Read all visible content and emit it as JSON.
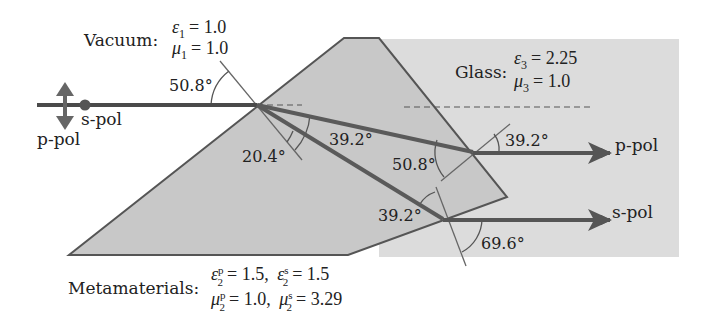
{
  "colors": {
    "glass_fill": "#dcdcdc",
    "meta_fill": "#c8c8c8",
    "beam": "#4a4a4a",
    "outline": "#555555",
    "normal_line": "#666666",
    "text": "#222222"
  },
  "media": {
    "vacuum": {
      "name": "Vacuum:",
      "eps_sym": "ε",
      "eps_sub": "1",
      "eps_val": "= 1.0",
      "mu_sym": "μ",
      "mu_sub": "1",
      "mu_val": "= 1.0"
    },
    "glass": {
      "name": "Glass:",
      "eps_sym": "ε",
      "eps_sub": "3",
      "eps_val": "= 2.25",
      "mu_sym": "μ",
      "mu_sub": "3",
      "mu_val": "= 1.0"
    },
    "metamaterial": {
      "name": "Metamaterials:",
      "eps_p_sym": "ε",
      "eps_p_sup": "p",
      "eps_p_sub": "2",
      "eps_p_val": "= 1.5,",
      "eps_s_sym": "ε",
      "eps_s_sup": "s",
      "eps_s_sub": "2",
      "eps_s_val": "= 1.5",
      "mu_p_sym": "μ",
      "mu_p_sup": "p",
      "mu_p_sub": "2",
      "mu_p_val": "= 1.0,",
      "mu_s_sym": "μ",
      "mu_s_sup": "s",
      "mu_s_sub": "2",
      "mu_s_val": "= 3.29"
    }
  },
  "polarization_labels": {
    "incident_s": "s-pol",
    "incident_p": "p-pol",
    "out_p": "p-pol",
    "out_s": "s-pol"
  },
  "angles": {
    "incidence": "50.8°",
    "refraction_split": "20.4°",
    "p_inner": "39.2°",
    "p_exit_inner": "50.8°",
    "p_exit_out": "39.2°",
    "s_exit_inner": "39.2°",
    "s_exit_out": "69.6°"
  }
}
